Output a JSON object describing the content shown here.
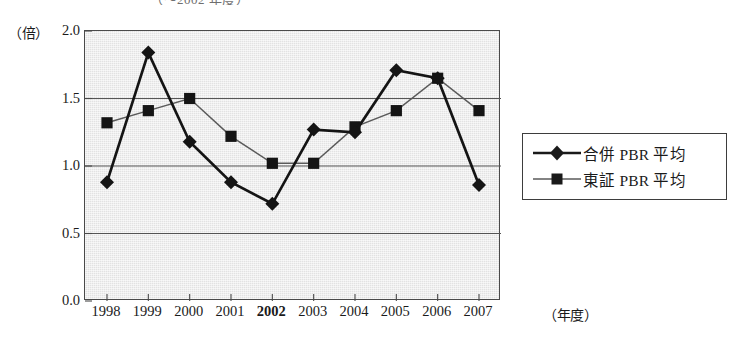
{
  "chart_data": {
    "type": "line",
    "title": "（～2002 年度）",
    "xlabel": "（年度）",
    "ylabel": "（倍）",
    "categories": [
      "1998",
      "1999",
      "2000",
      "2001",
      "2002",
      "2003",
      "2004",
      "2005",
      "2006",
      "2007"
    ],
    "bold_categories": [
      "2002"
    ],
    "ylim": [
      0.0,
      2.0
    ],
    "y_ticks": [
      "0.0",
      "0.5",
      "1.0",
      "1.5",
      "2.0"
    ],
    "y_tick_values": [
      0.0,
      0.5,
      1.0,
      1.5,
      2.0
    ],
    "grid": true,
    "grid_axis": "y",
    "legend_position": "right",
    "series": [
      {
        "name": "合併 PBR 平均",
        "marker": "diamond",
        "color": "#1a1a1a",
        "values": [
          0.88,
          1.84,
          1.18,
          0.88,
          0.72,
          1.27,
          1.25,
          1.71,
          1.65,
          0.86
        ]
      },
      {
        "name": "東証 PBR 平均",
        "marker": "square",
        "color": "#4d4d4d",
        "values": [
          1.32,
          1.41,
          1.5,
          1.22,
          1.02,
          1.02,
          1.29,
          1.41,
          1.65,
          1.41
        ]
      }
    ]
  },
  "legend": {
    "items": [
      {
        "label": "合併 PBR 平均",
        "marker": "diamond"
      },
      {
        "label": "東証 PBR 平均",
        "marker": "square"
      }
    ]
  },
  "axes": {
    "y_unit": "（倍）",
    "x_unit": "（年度）"
  }
}
